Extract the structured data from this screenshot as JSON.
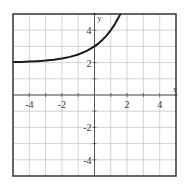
{
  "chart_data": {
    "type": "line",
    "title": "",
    "xlabel": "x",
    "ylabel": "y",
    "xlim": [
      -5,
      5
    ],
    "ylim": [
      -5,
      5
    ],
    "grid": true,
    "grid_step": 1,
    "x_ticks": [
      -4,
      -2,
      2,
      4
    ],
    "x_tick_labels": [
      "-4",
      "-2",
      "2",
      "4"
    ],
    "y_ticks": [
      -4,
      -2,
      2,
      4
    ],
    "y_tick_labels": [
      "-4",
      "-2",
      "2",
      "4"
    ],
    "legend": null,
    "series": [
      {
        "name": "y = 2 + 2^x",
        "x": [
          -5,
          -4.5,
          -4,
          -3.5,
          -3,
          -2.5,
          -2,
          -1.5,
          -1,
          -0.5,
          0,
          0.25,
          0.5,
          0.75,
          1,
          1.25,
          1.5,
          1.585
        ],
        "y": [
          2.031,
          2.044,
          2.063,
          2.088,
          2.125,
          2.177,
          2.25,
          2.354,
          2.5,
          2.707,
          3.0,
          3.189,
          3.414,
          3.682,
          4.0,
          4.378,
          4.828,
          5.0
        ],
        "color": "#1a1a1a"
      }
    ],
    "asymptote_y": 2
  },
  "colors": {
    "grid": "#c8c8c8",
    "axis": "#555555",
    "frame": "#444444",
    "curve": "#1a1a1a"
  }
}
